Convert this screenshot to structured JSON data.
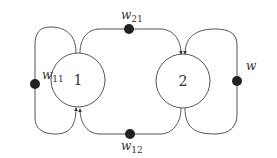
{
  "diagram": {
    "type": "network-graph",
    "stroke_color": "#555555",
    "dot_color": "#222222",
    "nodes": [
      {
        "id": "1",
        "label": "1"
      },
      {
        "id": "2",
        "label": "2"
      }
    ],
    "edges": [
      {
        "from": "1",
        "to": "1",
        "label_base": "w",
        "label_sub": "11",
        "label": "w11"
      },
      {
        "from": "1",
        "to": "2",
        "label_base": "w",
        "label_sub": "21",
        "label": "w21"
      },
      {
        "from": "2",
        "to": "1",
        "label_base": "w",
        "label_sub": "12",
        "label": "w12"
      },
      {
        "from": "2",
        "to": "2",
        "label_base": "w",
        "label_sub": "",
        "label": "w"
      }
    ]
  }
}
